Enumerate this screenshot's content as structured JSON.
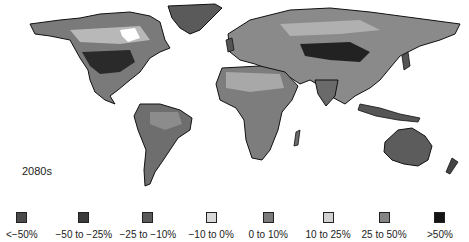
{
  "map": {
    "period_label": "2080s",
    "land_base": "#6e6e6e",
    "ocean": "#ffffff"
  },
  "legend": {
    "items": [
      {
        "label": "<−50%",
        "color": "#4a4a4a",
        "cx": 22
      },
      {
        "label": "−50 to −25%",
        "color": "#3a3a3a",
        "cx": 84
      },
      {
        "label": "−25 to −10%",
        "color": "#5a5a5a",
        "cx": 148
      },
      {
        "label": "−10 to 0%",
        "color": "#d8d8d8",
        "cx": 211
      },
      {
        "label": "0 to 10%",
        "color": "#7a7a7a",
        "cx": 268
      },
      {
        "label": "10 to 25%",
        "color": "#d0d0d0",
        "cx": 328
      },
      {
        "label": "25 to 50%",
        "color": "#858585",
        "cx": 384
      },
      {
        "label": ">50%",
        "color": "#141414",
        "cx": 440
      }
    ]
  }
}
